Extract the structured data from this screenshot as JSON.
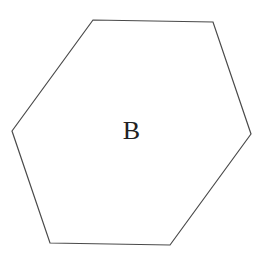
{
  "diagram": {
    "shape": "hexagon",
    "label": "B",
    "stroke_color": "#4a4a4a",
    "fill_color": "#ffffff",
    "label_color": "#222222",
    "vertices": [
      [
        93,
        20
      ],
      [
        213,
        22
      ],
      [
        251,
        134
      ],
      [
        170,
        245
      ],
      [
        50,
        243
      ],
      [
        12,
        131
      ]
    ]
  }
}
